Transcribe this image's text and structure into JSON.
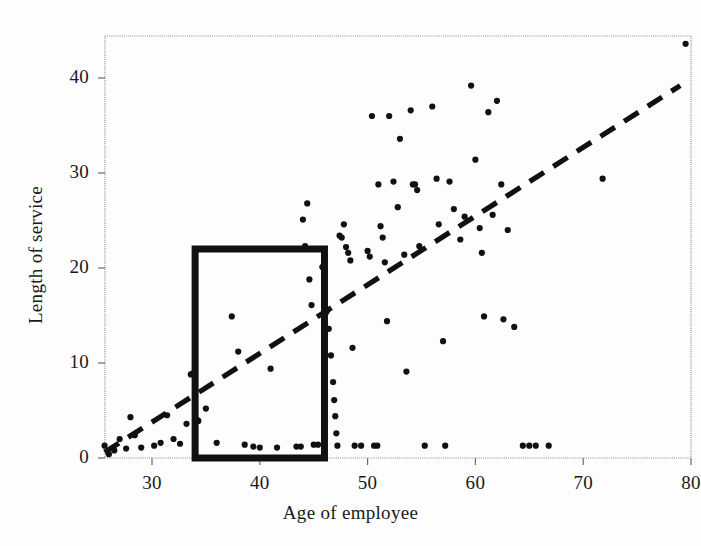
{
  "chart_data": {
    "type": "scatter",
    "title": "",
    "xlabel": "Age of employee",
    "ylabel": "Length of service",
    "xlim": [
      25,
      80
    ],
    "ylim": [
      -0.5,
      44.5
    ],
    "xticks": [
      30,
      40,
      50,
      60,
      70,
      80
    ],
    "yticks": [
      0,
      10,
      20,
      30,
      40
    ],
    "grid": false,
    "legend": null,
    "marker": "filled-circle",
    "marker_color": "#111111",
    "series": [
      {
        "name": "employees",
        "points": [
          [
            25.6,
            1.3
          ],
          [
            26.0,
            0.4
          ],
          [
            26.5,
            0.8
          ],
          [
            27.0,
            2.0
          ],
          [
            27.6,
            1.0
          ],
          [
            28.0,
            4.3
          ],
          [
            28.4,
            2.4
          ],
          [
            29.0,
            1.1
          ],
          [
            30.2,
            1.3
          ],
          [
            30.8,
            1.6
          ],
          [
            31.4,
            4.5
          ],
          [
            32.0,
            2.0
          ],
          [
            32.6,
            1.5
          ],
          [
            33.2,
            3.6
          ],
          [
            33.6,
            8.8
          ],
          [
            33.8,
            8.9
          ],
          [
            34.0,
            4.2
          ],
          [
            34.2,
            4.0
          ],
          [
            34.3,
            3.9
          ],
          [
            35.0,
            5.2
          ],
          [
            36.0,
            1.6
          ],
          [
            37.4,
            14.9
          ],
          [
            38.0,
            11.2
          ],
          [
            38.6,
            1.4
          ],
          [
            39.4,
            1.2
          ],
          [
            40.0,
            1.1
          ],
          [
            41.0,
            9.4
          ],
          [
            41.6,
            1.1
          ],
          [
            43.4,
            1.2
          ],
          [
            43.8,
            1.2
          ],
          [
            44.0,
            25.1
          ],
          [
            44.2,
            22.3
          ],
          [
            44.4,
            26.8
          ],
          [
            44.6,
            18.8
          ],
          [
            44.8,
            16.1
          ],
          [
            45.0,
            1.4
          ],
          [
            45.4,
            1.4
          ],
          [
            45.8,
            20.1
          ],
          [
            46.0,
            19.5
          ],
          [
            46.2,
            15.4
          ],
          [
            46.4,
            13.6
          ],
          [
            46.6,
            10.8
          ],
          [
            46.8,
            8.0
          ],
          [
            46.9,
            6.1
          ],
          [
            47.0,
            4.4
          ],
          [
            47.1,
            2.6
          ],
          [
            47.2,
            1.3
          ],
          [
            47.4,
            23.4
          ],
          [
            47.6,
            23.2
          ],
          [
            47.8,
            24.6
          ],
          [
            48.0,
            22.2
          ],
          [
            48.2,
            21.6
          ],
          [
            48.4,
            20.8
          ],
          [
            48.6,
            11.6
          ],
          [
            48.8,
            1.3
          ],
          [
            49.4,
            1.3
          ],
          [
            50.0,
            21.8
          ],
          [
            50.2,
            21.2
          ],
          [
            50.4,
            36.0
          ],
          [
            50.6,
            1.3
          ],
          [
            50.9,
            1.3
          ],
          [
            51.0,
            28.8
          ],
          [
            51.2,
            24.4
          ],
          [
            51.4,
            23.2
          ],
          [
            51.6,
            20.6
          ],
          [
            51.8,
            14.4
          ],
          [
            52.0,
            36.0
          ],
          [
            52.4,
            29.1
          ],
          [
            52.8,
            26.4
          ],
          [
            53.0,
            33.6
          ],
          [
            53.4,
            21.4
          ],
          [
            53.6,
            9.1
          ],
          [
            54.0,
            36.6
          ],
          [
            54.2,
            28.8
          ],
          [
            54.4,
            28.8
          ],
          [
            54.6,
            28.2
          ],
          [
            54.8,
            22.3
          ],
          [
            55.3,
            1.3
          ],
          [
            56.0,
            37.0
          ],
          [
            56.4,
            29.4
          ],
          [
            56.6,
            24.6
          ],
          [
            57.0,
            12.3
          ],
          [
            57.2,
            1.3
          ],
          [
            57.6,
            29.1
          ],
          [
            58.0,
            26.2
          ],
          [
            58.6,
            23.0
          ],
          [
            59.0,
            25.4
          ],
          [
            59.6,
            39.2
          ],
          [
            60.0,
            31.4
          ],
          [
            60.4,
            24.2
          ],
          [
            60.6,
            21.6
          ],
          [
            60.8,
            14.9
          ],
          [
            61.2,
            36.4
          ],
          [
            61.6,
            25.6
          ],
          [
            62.0,
            37.6
          ],
          [
            62.4,
            28.8
          ],
          [
            62.6,
            14.6
          ],
          [
            63.0,
            24.0
          ],
          [
            63.6,
            13.8
          ],
          [
            64.4,
            1.3
          ],
          [
            65.0,
            1.3
          ],
          [
            65.6,
            1.3
          ],
          [
            66.8,
            1.3
          ],
          [
            71.8,
            29.4
          ],
          [
            79.5,
            43.6
          ]
        ]
      }
    ],
    "trend_line": {
      "style": "dashed",
      "color": "#111111",
      "x_start": 25.6,
      "y_start": 0.6,
      "x_end": 79.0,
      "y_end": 39.2
    },
    "highlight_box": {
      "label": "",
      "x_min": 34.0,
      "x_max": 46.0,
      "y_min": 0.0,
      "y_max": 22.0,
      "color": "#111111",
      "line_width": 7
    }
  }
}
